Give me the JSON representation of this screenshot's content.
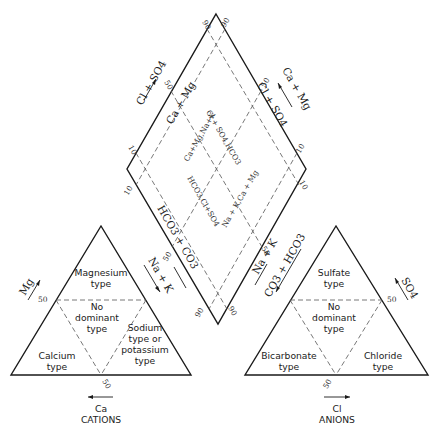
{
  "diagram": {
    "type": "piper-trilinear",
    "colors": {
      "line": "#1a1a1a",
      "dashed": "#555555",
      "background": "#ffffff"
    },
    "cations": {
      "caption": "CATIONS",
      "bottom_axis": "Ca",
      "left_axis": "Mg",
      "right_axis": "Na + K",
      "tick_left": "50",
      "tick_bottom": "50",
      "zones": {
        "top": [
          "Magnesium",
          "type"
        ],
        "center": [
          "No",
          "dominant",
          "type"
        ],
        "left": [
          "Calcium",
          "type"
        ],
        "right": [
          "Sodium",
          "type  or",
          "potassium",
          "type"
        ]
      }
    },
    "anions": {
      "caption": "ANIONS",
      "bottom_axis": "Cl",
      "right_axis": "SO4",
      "left_axis": "CO3 + HCO3",
      "tick_right": "50",
      "tick_bottom": "50",
      "zones": {
        "top": [
          "Sulfate",
          "type"
        ],
        "center": [
          "No",
          "dominant",
          "type"
        ],
        "left": [
          "Bicarbonate",
          "type"
        ],
        "right": [
          "Chloride",
          "type"
        ]
      }
    },
    "diamond": {
      "upper_left_outer": "Cl + SO4",
      "upper_left_inner": "Ca + Mg",
      "upper_right_outer": "Ca + Mg",
      "upper_right_inner": "Cl + SO4",
      "lower_left_inner": "HCO3 + CO3",
      "lower_right_inner": "Na + K",
      "ticks": {
        "top_left": "90",
        "top_right": "90",
        "mid_upper_left": "50",
        "mid_upper_right": "50",
        "left_upper": "10",
        "left_lower": "10",
        "right_upper": "10",
        "right_lower": "10",
        "bottom_left": "90",
        "bottom_right": "90",
        "mid_lower_left": "50",
        "mid_lower_right": "50"
      },
      "inner_labels": {
        "tl": "Ca+Mg,Na+K",
        "tr": "Cl + SO4,HCO3",
        "bl": "HCO3,Cl+SO4",
        "br": "Na + K,Ca + Mg"
      }
    }
  }
}
